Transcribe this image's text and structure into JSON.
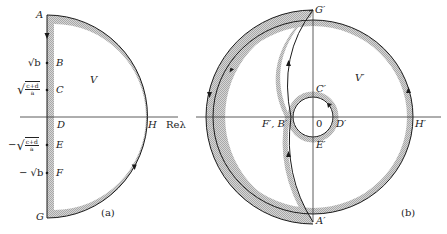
{
  "panel_a": {
    "caption": "(a)",
    "points": {
      "A": "A",
      "B": "B",
      "C": "C",
      "D": "D",
      "E": "E",
      "F": "F",
      "G": "G",
      "H": "H"
    },
    "region_label": "V",
    "axis_label": "Reλ",
    "tick_labels": {
      "sqrt_b": "√b",
      "sqrt_frac_num": "c+d",
      "sqrt_frac_den": "a",
      "neg_sqrt_b": "− √b",
      "neg_prefix": "−"
    }
  },
  "panel_b": {
    "caption": "(b)",
    "points": {
      "A": "A′",
      "C": "C′",
      "D": "D′",
      "E": "E′",
      "FB": "F′, B′",
      "G": "G′",
      "H": "H′",
      "O": "0"
    },
    "region_label": "V′"
  },
  "colors": {
    "line": "#1a1a1a",
    "hatch": "#bdbdbd",
    "axis": "#333333",
    "background": "#ffffff"
  }
}
